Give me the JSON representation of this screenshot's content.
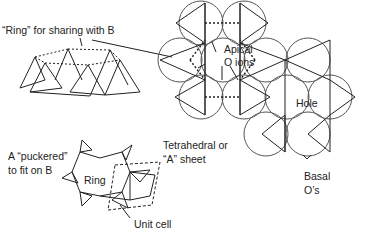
{
  "diagram": {
    "type": "silicate tetrahedral sheet",
    "labels": {
      "ring_sharing": "“Ring” for sharing with B",
      "apical_line1": "Apical",
      "apical_line2": "O ions",
      "hole": "Hole",
      "tetra_line1": "Tetrahedral or",
      "tetra_line2": "“A” sheet",
      "basal_line1": "Basal",
      "basal_line2": "O’s",
      "puckered_line1": "A “puckered”",
      "puckered_line2": "to fit on B",
      "ring": "Ring",
      "unit_cell": "Unit cell"
    },
    "colors": {
      "line": "#222222",
      "circle": "#555555",
      "background": "#ffffff"
    }
  }
}
